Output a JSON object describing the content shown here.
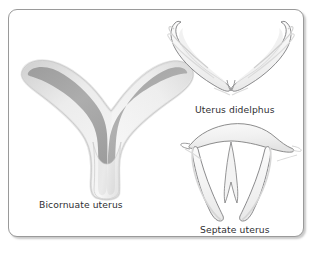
{
  "figure": {
    "background_color": "#ffffff",
    "frame": {
      "border_color": "#9a9a9a",
      "fill_color": "#ffffff",
      "corner_radius": "9px"
    },
    "label_color": "#2f2f33"
  },
  "diagram": {
    "type": "medical-illustration",
    "palette": {
      "outline": "#6e6e70",
      "body_light": "#f4f4f4",
      "body_mid": "#e2e2e2",
      "cavity_gray": "#a9a9a9",
      "cavity_gray_dark": "#9a9a9a",
      "wisp": "#d8d8d8"
    },
    "items": [
      {
        "id": "bicornuate",
        "label": "Bicornuate uterus",
        "description": "Trident shaped uterus with two divergent horns and a shaded central cavity",
        "shaded_cavity": true
      },
      {
        "id": "didelphus",
        "label": "Uterus didelphus",
        "description": "Two completely separate uterine horns forming a wide V outline",
        "shaded_cavity": false
      },
      {
        "id": "septate",
        "label": "Septate uterus",
        "description": "Single broad fundus divided by a central septum into two narrow cavities",
        "shaded_cavity": false
      }
    ]
  }
}
